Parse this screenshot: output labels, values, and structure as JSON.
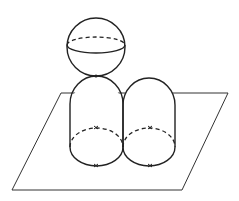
{
  "diagram": {
    "colors": {
      "stroke": "#222222",
      "background": "#ffffff"
    },
    "elements": [
      "plane",
      "sphere",
      "left-capsule",
      "right-capsule"
    ]
  }
}
